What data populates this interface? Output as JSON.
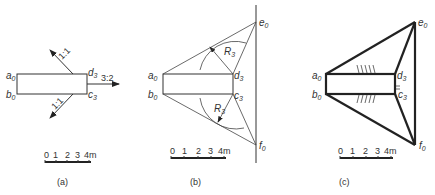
{
  "figures": [
    {
      "id": "a",
      "caption": "(a)",
      "points": {
        "a0": "a",
        "b0": "b",
        "d3": "d",
        "c3": "c"
      },
      "subscripts": {
        "a0": "0",
        "b0": "0",
        "d3": "3",
        "c3": "3"
      },
      "slopes": {
        "top": "1:1",
        "right": "3:2",
        "bottom": "1:1"
      },
      "scale": {
        "ticks": [
          "0",
          "1",
          "2",
          "3",
          "4m"
        ]
      }
    },
    {
      "id": "b",
      "caption": "(b)",
      "points": {
        "a0": "a",
        "b0": "b",
        "d3": "d",
        "c3": "c",
        "e0": "e",
        "f0": "f"
      },
      "subscripts": {
        "a0": "0",
        "b0": "0",
        "d3": "3",
        "c3": "3",
        "e0": "0",
        "f0": "0"
      },
      "radii": {
        "upper": "R",
        "lower": "R",
        "sub": "3"
      },
      "scale": {
        "ticks": [
          "0",
          "1",
          "2",
          "3",
          "4m"
        ]
      }
    },
    {
      "id": "c",
      "caption": "(c)",
      "points": {
        "a0": "a",
        "b0": "b",
        "d3": "d",
        "c3": "c",
        "e0": "e",
        "f0": "f"
      },
      "subscripts": {
        "a0": "0",
        "b0": "0",
        "d3": "3",
        "c3": "3",
        "e0": "0",
        "f0": "0"
      },
      "scale": {
        "ticks": [
          "0",
          "1",
          "2",
          "3",
          "4m"
        ]
      }
    }
  ]
}
